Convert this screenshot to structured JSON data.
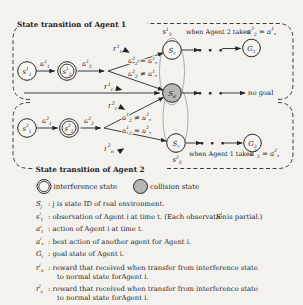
{
  "figure": {
    "dots": "• • •",
    "colors": {
      "paper": "#f3f2ee",
      "ink": "#1f1f1f",
      "collision": "#b7b7b3",
      "ellipse": "#a3a3a3"
    }
  },
  "shared": {
    "sd": {
      "base": "S",
      "sub": "d"
    }
  },
  "agent1": {
    "title": "State transition of Agent 1",
    "nodes": {
      "s1": {
        "base": "s",
        "sup": "1",
        "sub": "1"
      },
      "s2": {
        "base": "s",
        "sup": "1",
        "sub": "2"
      },
      "sr": {
        "base": "S",
        "sub": "r"
      },
      "s3": {
        "base": "s",
        "sup": "1",
        "sub": "3"
      },
      "goal": {
        "base": "G",
        "sub": "1"
      }
    },
    "labels": {
      "a1": {
        "base": "a",
        "sup": "1",
        "sub": "1"
      },
      "a2": {
        "base": "a",
        "sup": "1",
        "sub": "2"
      },
      "rn": {
        "base": "r",
        "sup": "1",
        "sub": "n"
      },
      "rc": {
        "base": "r",
        "sup": "1",
        "sub": "c"
      },
      "cond_eq": {
        "a": {
          "base": "a",
          "sup": "2",
          "sub": "2"
        },
        "rel": "=",
        "b": {
          "base": "a",
          "sup": "1",
          "sub": "*"
        }
      },
      "cond_ne": {
        "a": {
          "base": "a",
          "sup": "2",
          "sub": "2"
        },
        "rel": "≠",
        "b": {
          "base": "a",
          "sup": "1",
          "sub": "*"
        }
      },
      "when_prefix": "when Agent 2 takes",
      "when_cond": {
        "a": {
          "base": "a",
          "sup": "2",
          "sub": "2"
        },
        "rel": "=",
        "b": {
          "base": "a",
          "sup": "1",
          "sub": "*"
        }
      },
      "no_goal": "no goal"
    }
  },
  "agent2": {
    "title": "State transition of Agent 2",
    "nodes": {
      "s1": {
        "base": "s",
        "sup": "2",
        "sub": "1"
      },
      "s2": {
        "base": "s",
        "sup": "2",
        "sub": "2"
      },
      "sr": {
        "base": "S",
        "sub": "r"
      },
      "s3": {
        "base": "s",
        "sup": "2",
        "sub": "3"
      },
      "goal": {
        "base": "G",
        "sub": "2"
      }
    },
    "labels": {
      "a1": {
        "base": "a",
        "sup": "2",
        "sub": "1"
      },
      "a2": {
        "base": "a",
        "sup": "2",
        "sub": "2"
      },
      "rc": {
        "base": "r",
        "sup": "2",
        "sub": "c"
      },
      "rn": {
        "base": "r",
        "sup": "2",
        "sub": "n"
      },
      "cond_ne": {
        "a": {
          "base": "a",
          "sup": "1",
          "sub": "2"
        },
        "rel": "≠",
        "b": {
          "base": "a",
          "sup": "2",
          "sub": "*"
        }
      },
      "cond_eq": {
        "a": {
          "base": "a",
          "sup": "1",
          "sub": "2"
        },
        "rel": "=",
        "b": {
          "base": "a",
          "sup": "2",
          "sub": "*"
        }
      },
      "when_prefix": "when Agent 1 takes",
      "when_cond": {
        "a": {
          "base": "a",
          "sup": "1",
          "sub": "2"
        },
        "rel": "=",
        "b": {
          "base": "a",
          "sup": "2",
          "sub": "*"
        }
      }
    }
  },
  "legend": {
    "interference": "interference state",
    "collision": "collision state"
  },
  "definitions": [
    {
      "sym": {
        "base": "S",
        "sub": "j"
      },
      "line1": ":  j is state ID of real environment."
    },
    {
      "sym": {
        "base": "s",
        "sup": "i",
        "sub": "t"
      },
      "line1": ":  observation of Agent i at time t. (Each observation",
      "sym2": {
        "base": "S",
        "sup": "i"
      },
      "line1b": "is partial.)"
    },
    {
      "sym": {
        "base": "a",
        "sup": "i",
        "sub": "t"
      },
      "line1": ":  action of Agent i at time t."
    },
    {
      "sym": {
        "base": "a",
        "sup": "i",
        "sub": "*"
      },
      "line1": ":  best action of another agent for Agent i."
    },
    {
      "sym": {
        "base": "G",
        "sub": "i"
      },
      "line1": ":  goal state of Agent i."
    },
    {
      "sym": {
        "base": "r",
        "sup": "i",
        "sub": "n"
      },
      "line1": ":  reward that received when transfer from interference state",
      "line2": "to normal state forAgent i."
    },
    {
      "sym": {
        "base": "r",
        "sup": "i",
        "sub": "c"
      },
      "line1": ":  reward that received when transfer from interference state",
      "line2": "to normal state forAgent i."
    }
  ]
}
